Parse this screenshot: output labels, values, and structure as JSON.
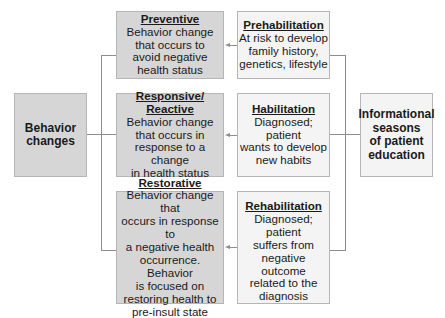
{
  "left_box": {
    "lines": [
      "Behavior",
      "changes"
    ]
  },
  "right_box": {
    "lines": [
      "Informational",
      "seasons",
      "of patient",
      "education"
    ]
  },
  "behavior_types": [
    {
      "title": "Preventive",
      "lines": [
        "Behavior change",
        "that occurs to",
        "avoid negative",
        "health status"
      ]
    },
    {
      "title": "Responsive/",
      "title2": "Reactive",
      "lines": [
        "Behavior change",
        "that occurs in",
        "response to a change",
        "in health status"
      ]
    },
    {
      "title": "Restorative",
      "lines": [
        "Behavior change that",
        "occurs in response to",
        "a negative health",
        "occurrence. Behavior",
        "is focused on",
        "restoring health to",
        "pre-insult state"
      ]
    }
  ],
  "education_seasons": [
    {
      "title": "Prehabilitation",
      "lines": [
        "At risk to develop",
        "family history,",
        "genetics, lifestyle"
      ]
    },
    {
      "title": "Habilitation",
      "lines": [
        "Diagnosed; patient",
        "wants to develop",
        "new habits"
      ]
    },
    {
      "title": "Rehabilitation",
      "lines": [
        "Diagnosed; patient",
        "suffers from",
        "negative outcome",
        "related to the",
        "diagnosis"
      ]
    }
  ],
  "colors": {
    "gray_box": "#d6d6d6",
    "white_box": "#f4f4f4",
    "border": "#b5b5b5",
    "connector": "#8d8d8d"
  }
}
